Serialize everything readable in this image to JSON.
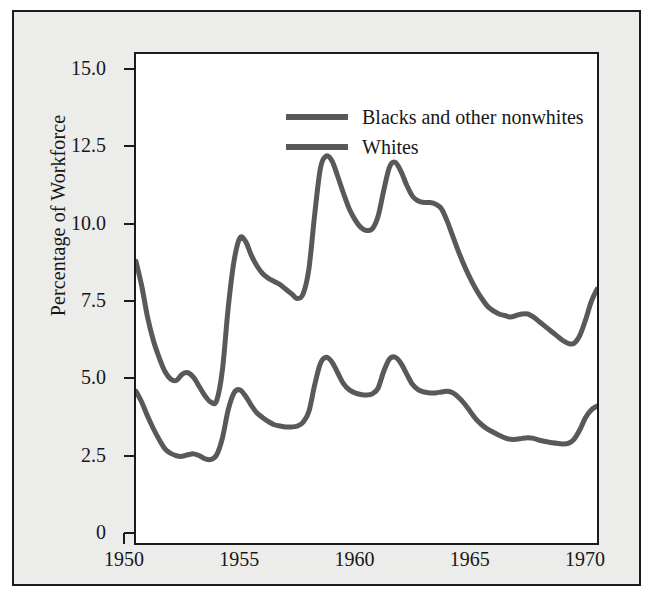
{
  "chart_data": {
    "type": "line",
    "title": "",
    "subtitle": "",
    "xlabel": "",
    "ylabel": "Percentage of Workforce",
    "xlim": [
      1950,
      1970
    ],
    "ylim": [
      0,
      15.8
    ],
    "grid": false,
    "legend_position": "top-left",
    "x_ticks": [
      "1950",
      "1955",
      "1960",
      "1965",
      "1970"
    ],
    "x_tick_values": [
      1950,
      1955,
      1960,
      1965,
      1970
    ],
    "y_ticks": [
      "15.0",
      "12.5",
      "10.0",
      "7.5",
      "5.0",
      "2.5",
      "0"
    ],
    "y_tick_values": [
      15.0,
      12.5,
      10.0,
      7.5,
      5.0,
      2.5,
      0
    ],
    "line_color": "#595959",
    "line_width": 5,
    "x": [
      1950.0,
      1950.25,
      1950.5,
      1950.75,
      1951.0,
      1951.25,
      1951.5,
      1951.75,
      1952.0,
      1952.25,
      1952.5,
      1952.75,
      1953.0,
      1953.25,
      1953.5,
      1953.75,
      1954.0,
      1954.25,
      1954.5,
      1954.75,
      1955.0,
      1955.25,
      1955.5,
      1955.75,
      1956.0,
      1956.25,
      1956.5,
      1956.75,
      1957.0,
      1957.25,
      1957.5,
      1957.75,
      1958.0,
      1958.25,
      1958.5,
      1958.75,
      1959.0,
      1959.25,
      1959.5,
      1959.75,
      1960.0,
      1960.25,
      1960.5,
      1960.75,
      1961.0,
      1961.25,
      1961.5,
      1961.75,
      1962.0,
      1962.25,
      1962.5,
      1962.75,
      1963.0,
      1963.25,
      1963.5,
      1963.75,
      1964.0,
      1964.25,
      1964.5,
      1964.75,
      1965.0,
      1965.25,
      1965.5,
      1965.75,
      1966.0,
      1966.25,
      1966.5,
      1966.75,
      1967.0,
      1967.25,
      1967.5,
      1967.75,
      1968.0,
      1968.25,
      1968.5,
      1968.75,
      1969.0,
      1969.25,
      1969.5,
      1969.75,
      1970.0
    ],
    "series": [
      {
        "name": "Blacks and other nonwhites",
        "color": "#595959",
        "values": [
          9.1,
          8.3,
          7.3,
          6.55,
          6.0,
          5.55,
          5.3,
          5.25,
          5.45,
          5.5,
          5.35,
          5.05,
          4.75,
          4.55,
          4.6,
          5.6,
          7.6,
          9.1,
          9.85,
          9.75,
          9.3,
          8.95,
          8.7,
          8.55,
          8.45,
          8.35,
          8.2,
          8.05,
          7.9,
          8.05,
          8.85,
          10.6,
          12.1,
          12.5,
          12.35,
          11.85,
          11.3,
          10.8,
          10.45,
          10.2,
          10.1,
          10.15,
          10.55,
          11.4,
          12.15,
          12.3,
          12.0,
          11.55,
          11.2,
          11.05,
          11.0,
          11.0,
          10.95,
          10.8,
          10.4,
          9.9,
          9.4,
          8.95,
          8.55,
          8.2,
          7.9,
          7.65,
          7.5,
          7.4,
          7.35,
          7.3,
          7.35,
          7.4,
          7.4,
          7.3,
          7.15,
          7.0,
          6.85,
          6.7,
          6.55,
          6.45,
          6.45,
          6.7,
          7.2,
          7.8,
          8.2
        ]
      },
      {
        "name": "Whites",
        "color": "#595959",
        "values": [
          4.9,
          4.55,
          4.1,
          3.7,
          3.35,
          3.05,
          2.9,
          2.82,
          2.8,
          2.85,
          2.88,
          2.82,
          2.72,
          2.7,
          2.85,
          3.4,
          4.3,
          4.85,
          4.95,
          4.75,
          4.45,
          4.2,
          4.05,
          3.92,
          3.82,
          3.78,
          3.75,
          3.75,
          3.78,
          3.9,
          4.25,
          5.1,
          5.8,
          6.0,
          5.85,
          5.5,
          5.15,
          4.95,
          4.85,
          4.8,
          4.78,
          4.82,
          5.0,
          5.55,
          5.95,
          6.0,
          5.8,
          5.45,
          5.12,
          4.95,
          4.88,
          4.85,
          4.85,
          4.88,
          4.9,
          4.85,
          4.7,
          4.5,
          4.25,
          4.0,
          3.82,
          3.68,
          3.58,
          3.48,
          3.4,
          3.35,
          3.35,
          3.38,
          3.4,
          3.38,
          3.32,
          3.28,
          3.25,
          3.22,
          3.2,
          3.22,
          3.35,
          3.65,
          4.05,
          4.3,
          4.42
        ]
      }
    ]
  },
  "legend": {
    "items": [
      {
        "label": "Blacks and other nonwhites"
      },
      {
        "label": "Whites"
      }
    ]
  }
}
